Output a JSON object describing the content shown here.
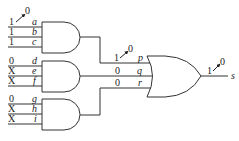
{
  "diagram": {
    "type": "logic-circuit",
    "and_gates": [
      {
        "inputs": [
          {
            "name": "a",
            "value": "1",
            "change": "0"
          },
          {
            "name": "b",
            "value": "1"
          },
          {
            "name": "c",
            "value": "1"
          }
        ]
      },
      {
        "inputs": [
          {
            "name": "d",
            "value": "0"
          },
          {
            "name": "e",
            "value": "X"
          },
          {
            "name": "f",
            "value": "X"
          }
        ]
      },
      {
        "inputs": [
          {
            "name": "g",
            "value": "0"
          },
          {
            "name": "h",
            "value": "X"
          },
          {
            "name": "i",
            "value": "X"
          }
        ]
      }
    ],
    "or_gate": {
      "inputs": [
        {
          "name": "p",
          "value": "1",
          "change": "0"
        },
        {
          "name": "q",
          "value": "0"
        },
        {
          "name": "r",
          "value": "0"
        }
      ],
      "output": {
        "name": "s",
        "value": "1",
        "change": "0"
      }
    },
    "colors": {
      "stroke": "#333333",
      "text": "#222222",
      "background": "#ffffff"
    }
  }
}
